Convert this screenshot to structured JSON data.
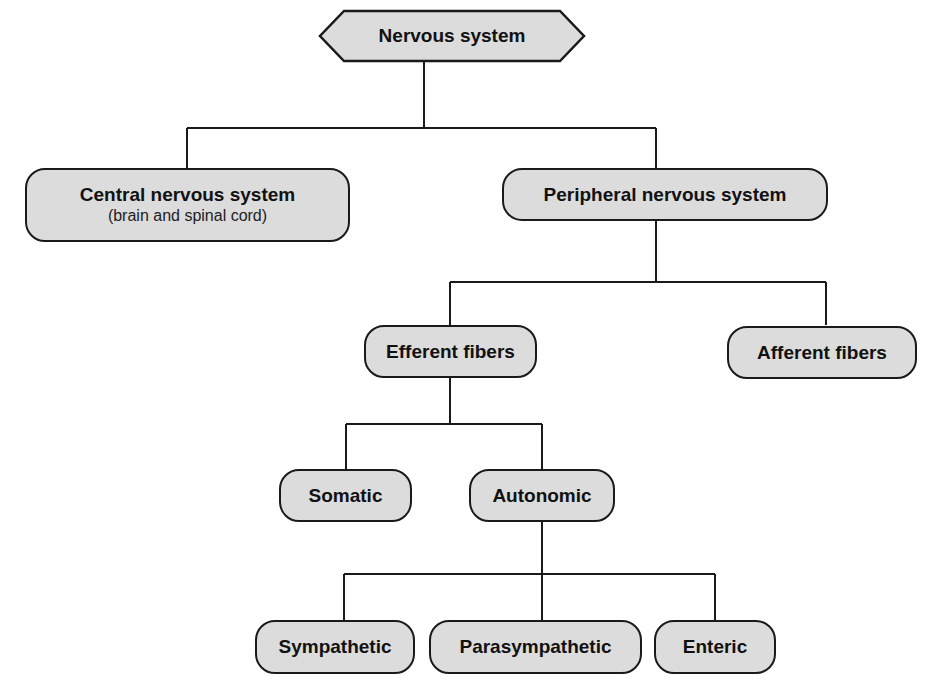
{
  "diagram": {
    "title": "Nervous system",
    "colors": {
      "node_fill": "#dcdcdc",
      "stroke": "#1a1a1a",
      "background": "#ffffff"
    },
    "nodes": {
      "root": {
        "label": "Nervous system",
        "shape": "hexagon"
      },
      "cns": {
        "label": "Central nervous system",
        "sublabel": "(brain and spinal cord)"
      },
      "pns": {
        "label": "Peripheral nervous system"
      },
      "efferent": {
        "label": "Efferent fibers"
      },
      "afferent": {
        "label": "Afferent fibers"
      },
      "somatic": {
        "label": "Somatic"
      },
      "autonomic": {
        "label": "Autonomic"
      },
      "sympathetic": {
        "label": "Sympathetic"
      },
      "parasympathetic": {
        "label": "Parasympathetic"
      },
      "enteric": {
        "label": "Enteric"
      }
    },
    "edges": [
      [
        "root",
        "cns"
      ],
      [
        "root",
        "pns"
      ],
      [
        "pns",
        "efferent"
      ],
      [
        "pns",
        "afferent"
      ],
      [
        "efferent",
        "somatic"
      ],
      [
        "efferent",
        "autonomic"
      ],
      [
        "autonomic",
        "sympathetic"
      ],
      [
        "autonomic",
        "parasympathetic"
      ],
      [
        "autonomic",
        "enteric"
      ]
    ]
  }
}
